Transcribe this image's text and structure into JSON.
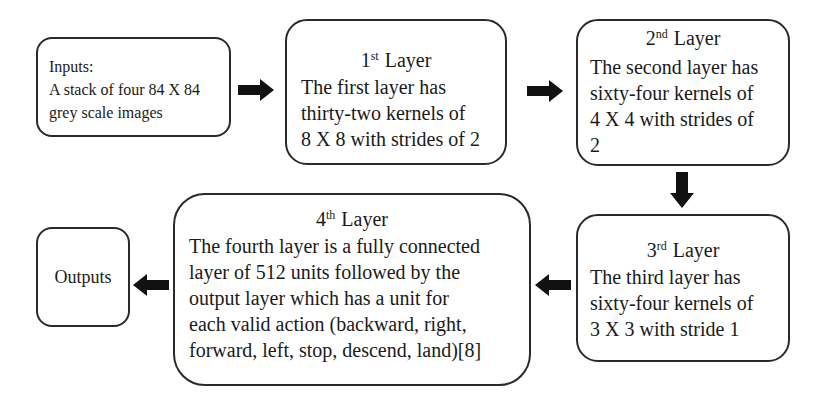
{
  "diagram": {
    "type": "flowchart",
    "nodes": [
      {
        "id": "inputs",
        "title": "Inputs:",
        "lines": [
          "A stack of four 84 X 84",
          "grey scale images"
        ]
      },
      {
        "id": "layer1",
        "ordinal": "1",
        "suffix": "st",
        "title": "Layer",
        "lines": [
          "The first layer has",
          "thirty-two kernels of",
          "8 X 8 with strides of 2"
        ]
      },
      {
        "id": "layer2",
        "ordinal": "2",
        "suffix": "nd",
        "title": "Layer",
        "lines": [
          "The second layer has",
          "sixty-four kernels of",
          "4 X 4 with strides of",
          "2"
        ]
      },
      {
        "id": "layer3",
        "ordinal": "3",
        "suffix": "rd",
        "title": "Layer",
        "lines": [
          "The third layer has",
          "sixty-four kernels of",
          "3 X 3 with stride 1"
        ]
      },
      {
        "id": "layer4",
        "ordinal": "4",
        "suffix": "th",
        "title": "Layer",
        "lines": [
          "The fourth layer is a fully connected",
          "layer of 512 units followed by the",
          "output layer which has a unit for",
          "each valid action (backward, right,",
          "forward, left, stop, descend, land)[8]"
        ]
      },
      {
        "id": "outputs",
        "label": "Outputs"
      }
    ],
    "edges": [
      {
        "from": "inputs",
        "to": "layer1",
        "direction": "right"
      },
      {
        "from": "layer1",
        "to": "layer2",
        "direction": "right"
      },
      {
        "from": "layer2",
        "to": "layer3",
        "direction": "down"
      },
      {
        "from": "layer3",
        "to": "layer4",
        "direction": "left"
      },
      {
        "from": "layer4",
        "to": "outputs",
        "direction": "left"
      }
    ],
    "colors": {
      "border": "#2a2a2a",
      "arrow": "#111111",
      "background": "#ffffff",
      "text": "#1a1a1a"
    }
  }
}
